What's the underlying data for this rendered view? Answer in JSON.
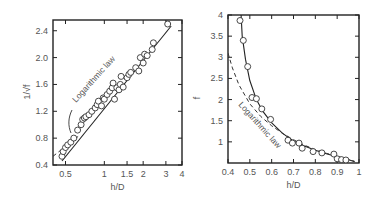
{
  "chart_data": [
    {
      "type": "scatter",
      "title": "",
      "xlabel": "h/D",
      "ylabel": "1/√f",
      "xscale": "log",
      "xlim": [
        0.4,
        4
      ],
      "ylim": [
        0.4,
        2.56
      ],
      "xticks": [
        0.5,
        1,
        1.5,
        2,
        3,
        4
      ],
      "xtick_labels": [
        "0.5",
        "1",
        "1.5",
        "2",
        "3",
        "4"
      ],
      "yticks": [
        0.4,
        0.8,
        1.2,
        1.6,
        2.0,
        2.4
      ],
      "ytick_labels": [
        "0.4",
        "0.8",
        "1.2",
        "1.6",
        "2.0",
        "2.4"
      ],
      "grid": false,
      "annotations": [
        {
          "text": "Logarithmic law",
          "rotation": -48
        }
      ],
      "series": [
        {
          "name": "Experimental data",
          "style": "open-circles",
          "x": [
            0.47,
            0.48,
            0.5,
            0.52,
            0.55,
            0.58,
            0.62,
            0.66,
            0.68,
            0.7,
            0.72,
            0.76,
            0.8,
            0.85,
            0.88,
            0.9,
            0.95,
            0.98,
            1.0,
            1.05,
            1.1,
            1.15,
            1.17,
            1.2,
            1.25,
            1.3,
            1.33,
            1.35,
            1.4,
            1.5,
            1.55,
            1.6,
            1.75,
            1.85,
            1.9,
            2.0,
            2.05,
            2.15,
            2.35,
            2.4,
            3.1
          ],
          "y": [
            0.53,
            0.6,
            0.66,
            0.7,
            0.74,
            0.8,
            0.92,
            1.0,
            1.08,
            1.1,
            1.12,
            1.15,
            1.2,
            1.25,
            1.3,
            1.35,
            1.28,
            1.4,
            1.38,
            1.45,
            1.5,
            1.55,
            1.62,
            1.38,
            1.55,
            1.52,
            1.6,
            1.72,
            1.56,
            1.7,
            1.75,
            1.78,
            1.85,
            1.8,
            2.0,
            1.92,
            2.05,
            2.03,
            2.12,
            2.22,
            2.5
          ]
        },
        {
          "name": "Fit (solid)",
          "style": "solid-line",
          "x": [
            0.47,
            3.3
          ],
          "y": [
            0.46,
            2.47
          ]
        },
        {
          "name": "Logarithmic law",
          "style": "dashed-line",
          "x": [
            0.4,
            0.65
          ],
          "y": [
            0.53,
            0.85
          ]
        }
      ]
    },
    {
      "type": "scatter",
      "title": "",
      "xlabel": "h/D",
      "ylabel": "f",
      "xscale": "linear",
      "xlim": [
        0.4,
        1.0
      ],
      "ylim": [
        0.5,
        4.0
      ],
      "xticks": [
        0.4,
        0.5,
        0.6,
        0.7,
        0.8,
        0.9,
        1.0
      ],
      "xtick_labels": [
        "0.4",
        "0.5",
        "0.6",
        "0.7",
        "0.8",
        "0.9",
        "1"
      ],
      "yticks": [
        1,
        1.5,
        2,
        2.5,
        3,
        3.5,
        4
      ],
      "ytick_labels": [
        "1",
        "1.5",
        "2",
        "2.5",
        "3",
        "3.5",
        "4"
      ],
      "grid": false,
      "annotations": [
        {
          "text": "Logarithmic law",
          "rotation": 48
        }
      ],
      "series": [
        {
          "name": "Experimental data",
          "style": "open-circles",
          "x": [
            0.455,
            0.47,
            0.49,
            0.51,
            0.53,
            0.555,
            0.595,
            0.675,
            0.695,
            0.725,
            0.74,
            0.79,
            0.83,
            0.885,
            0.9,
            0.92,
            0.94
          ],
          "y": [
            3.87,
            3.4,
            2.78,
            2.05,
            2.02,
            1.78,
            1.53,
            1.04,
            0.97,
            0.97,
            0.85,
            0.77,
            0.74,
            0.71,
            0.6,
            0.58,
            0.57
          ]
        },
        {
          "name": "Fit (solid)",
          "style": "solid-line",
          "x": [
            0.46,
            0.465,
            0.48,
            0.5,
            0.53,
            0.56,
            0.6,
            0.65,
            0.7,
            0.75,
            0.8,
            0.85,
            0.9,
            0.95,
            0.98
          ],
          "y": [
            4.0,
            3.5,
            2.95,
            2.45,
            2.0,
            1.72,
            1.45,
            1.2,
            1.02,
            0.9,
            0.8,
            0.72,
            0.65,
            0.58,
            0.53
          ]
        },
        {
          "name": "Logarithmic law",
          "style": "dashed-line",
          "x": [
            0.4,
            0.42,
            0.45,
            0.5,
            0.55,
            0.6,
            0.65,
            0.7,
            0.75,
            0.8,
            0.85,
            0.9,
            0.95,
            0.98
          ],
          "y": [
            3.1,
            2.75,
            2.35,
            1.9,
            1.6,
            1.38,
            1.2,
            1.05,
            0.92,
            0.82,
            0.73,
            0.66,
            0.59,
            0.54
          ]
        }
      ]
    }
  ]
}
